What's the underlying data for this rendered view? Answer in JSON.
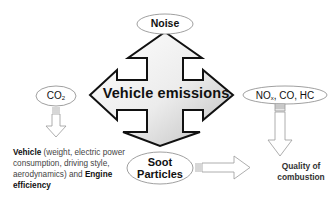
{
  "diagram": {
    "center": {
      "label": "Vehicle emissions"
    },
    "nodes": {
      "noise": {
        "label": "Noise"
      },
      "co2": {
        "label_main": "CO",
        "label_sub": "2"
      },
      "nox": {
        "label_1": "NO",
        "label_sub": "x",
        "label_2": ", CO, HC"
      },
      "soot": {
        "line1": "Soot",
        "line2": "Particles"
      }
    },
    "outcomes": {
      "vehicle": {
        "bold1": "Vehicle",
        "text1": " (weight, electric power consumption, driving style, aerodynamics) and ",
        "bold2": "Engine efficiency"
      },
      "quality": {
        "line1": "Quality of",
        "line2": "combustion"
      }
    },
    "colors": {
      "arrow_fill_light": "#ffffff",
      "arrow_fill_dark": "#d0d0d0",
      "arrow_stroke": "#111111",
      "ellipse_stroke": "#888888",
      "hollow_arrow_stroke": "#999999"
    }
  }
}
